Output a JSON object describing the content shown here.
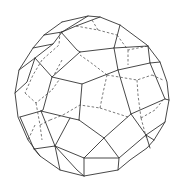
{
  "figure": {
    "colors": {
      "background": "#ffffff",
      "visible_edge": "#333333",
      "hidden_edge": "#555555"
    },
    "edge_styles": [
      "solid (visible)",
      "dashed (hidden)"
    ]
  }
}
